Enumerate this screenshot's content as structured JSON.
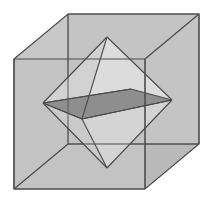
{
  "figure": {
    "caption": "",
    "width": 212,
    "height": 204,
    "background": "#ffffff",
    "projection": "oblique-parallel"
  },
  "palette": {
    "background": "#ffffff",
    "cube_face_front": "#c3c3c3",
    "cube_face_top": "#c8c8c8",
    "cube_face_left": "#bdbdbd",
    "cube_face_right": "#b9b9b9",
    "cube_face_bottom": "#c0c0c0",
    "octahedron_face_light": "#d6d6d6",
    "octahedron_face_lighter": "#dcdcdc",
    "octahedron_face_mid": "#cfcfcf",
    "equator_quad_dark": "#8e8e8e",
    "equator_quad_dark_right": "#9a9a9a",
    "stroke": "#4a4a4a",
    "stroke_light": "#5a5a5a",
    "stroke_hidden": "#6f6f6f"
  },
  "geometry": {
    "cube": {
      "label": "cube",
      "offset_x": 54,
      "offset_y": -45,
      "front_face": {
        "label": "front-face",
        "points": "14,59 145,59 145,189 14,189",
        "corners": {
          "top_left": [
            14,
            59
          ],
          "top_right": [
            145,
            59
          ],
          "bottom_right": [
            145,
            189
          ],
          "bottom_left": [
            14,
            189
          ]
        }
      },
      "back_face": {
        "label": "back-face",
        "points": "68,14 199,14 199,144 68,144",
        "corners": {
          "top_left": [
            68,
            14
          ],
          "top_right": [
            199,
            14
          ],
          "bottom_right": [
            199,
            144
          ],
          "bottom_left": [
            68,
            144
          ]
        }
      },
      "top_face": {
        "label": "top-face",
        "points": "14,59 68,14 199,14 145,59"
      },
      "left_face": {
        "label": "left-face",
        "points": "14,59 68,14 68,144 14,189"
      },
      "right_face": {
        "label": "right-face",
        "points": "145,59 199,14 199,144 145,189"
      },
      "bottom_face": {
        "label": "bottom-face",
        "points": "14,189 145,189 199,144 68,144"
      },
      "edges": [
        {
          "name": "front-top",
          "from": [
            14,
            59
          ],
          "to": [
            145,
            59
          ],
          "hidden": false
        },
        {
          "name": "front-right",
          "from": [
            145,
            59
          ],
          "to": [
            145,
            189
          ],
          "hidden": false
        },
        {
          "name": "front-bottom",
          "from": [
            14,
            189
          ],
          "to": [
            145,
            189
          ],
          "hidden": false
        },
        {
          "name": "front-left",
          "from": [
            14,
            59
          ],
          "to": [
            14,
            189
          ],
          "hidden": false
        },
        {
          "name": "back-top",
          "from": [
            68,
            14
          ],
          "to": [
            199,
            14
          ],
          "hidden": false
        },
        {
          "name": "back-right",
          "from": [
            199,
            14
          ],
          "to": [
            199,
            144
          ],
          "hidden": false
        },
        {
          "name": "back-bottom",
          "from": [
            68,
            144
          ],
          "to": [
            199,
            144
          ],
          "hidden": false
        },
        {
          "name": "back-left",
          "from": [
            68,
            14
          ],
          "to": [
            68,
            144
          ],
          "hidden": false
        },
        {
          "name": "connector-top-left",
          "from": [
            14,
            59
          ],
          "to": [
            68,
            14
          ],
          "hidden": false
        },
        {
          "name": "connector-top-right",
          "from": [
            145,
            59
          ],
          "to": [
            199,
            14
          ],
          "hidden": false
        },
        {
          "name": "connector-bottom-right",
          "from": [
            145,
            189
          ],
          "to": [
            199,
            144
          ],
          "hidden": false
        },
        {
          "name": "connector-bottom-left",
          "from": [
            14,
            189
          ],
          "to": [
            68,
            144
          ],
          "hidden": false
        }
      ]
    },
    "octahedron": {
      "label": "inscribed-octahedron",
      "vertices": {
        "top": [
          107,
          37
        ],
        "bottom": [
          107,
          168
        ],
        "left": [
          43,
          103
        ],
        "right": [
          172,
          100
        ],
        "front": [
          82,
          119
        ],
        "back": [
          131,
          89
        ]
      },
      "vertex_list": [
        {
          "name": "apex-top",
          "point": [
            107,
            37
          ],
          "note": "center of cube top face"
        },
        {
          "name": "apex-bottom",
          "point": [
            107,
            168
          ],
          "note": "center of cube bottom face"
        },
        {
          "name": "apex-left",
          "point": [
            43,
            103
          ],
          "note": "center of cube left face"
        },
        {
          "name": "apex-right",
          "point": [
            172,
            100
          ],
          "note": "center of cube right face"
        },
        {
          "name": "apex-front",
          "point": [
            82,
            119
          ],
          "note": "center of cube front face"
        },
        {
          "name": "apex-back",
          "point": [
            131,
            89
          ],
          "note": "center of cube back face"
        }
      ],
      "faces": [
        {
          "name": "face-top-front-left",
          "points": "107,37 82,119 43,103",
          "shade": "#d2d2d2",
          "hidden": false
        },
        {
          "name": "face-top-front-right",
          "points": "107,37 82,119 172,100",
          "shade": "#dcdcdc",
          "hidden": false
        },
        {
          "name": "face-top-back-left",
          "points": "107,37 131,89 43,103",
          "shade": "#cdcdcd",
          "hidden": true
        },
        {
          "name": "face-top-back-right",
          "points": "107,37 131,89 172,100",
          "shade": "#d6d6d6",
          "hidden": true
        },
        {
          "name": "face-bottom-front-left",
          "points": "107,168 82,119 43,103",
          "shade": "#cacaca",
          "hidden": false
        },
        {
          "name": "face-bottom-front-right",
          "points": "107,168 82,119 172,100",
          "shade": "#d4d4d4",
          "hidden": false
        },
        {
          "name": "face-bottom-back-left",
          "points": "107,168 131,89 43,103",
          "shade": "#d0d0d0",
          "hidden": true
        },
        {
          "name": "face-bottom-back-right",
          "points": "107,168 131,89 172,100",
          "shade": "#d8d8d8",
          "hidden": true
        }
      ],
      "edges": [
        {
          "name": "edge-top-left",
          "from": [
            107,
            37
          ],
          "to": [
            43,
            103
          ],
          "hidden": false
        },
        {
          "name": "edge-top-right",
          "from": [
            107,
            37
          ],
          "to": [
            172,
            100
          ],
          "hidden": false
        },
        {
          "name": "edge-top-front",
          "from": [
            107,
            37
          ],
          "to": [
            82,
            119
          ],
          "hidden": false
        },
        {
          "name": "edge-top-back",
          "from": [
            107,
            37
          ],
          "to": [
            131,
            89
          ],
          "hidden": true
        },
        {
          "name": "edge-bottom-left",
          "from": [
            107,
            168
          ],
          "to": [
            43,
            103
          ],
          "hidden": false
        },
        {
          "name": "edge-bottom-right",
          "from": [
            107,
            168
          ],
          "to": [
            172,
            100
          ],
          "hidden": false
        },
        {
          "name": "edge-bottom-front",
          "from": [
            107,
            168
          ],
          "to": [
            82,
            119
          ],
          "hidden": false
        },
        {
          "name": "edge-bottom-back",
          "from": [
            107,
            168
          ],
          "to": [
            131,
            89
          ],
          "hidden": true
        },
        {
          "name": "edge-equator-left-front",
          "from": [
            43,
            103
          ],
          "to": [
            82,
            119
          ],
          "hidden": false
        },
        {
          "name": "edge-equator-front-right",
          "from": [
            82,
            119
          ],
          "to": [
            172,
            100
          ],
          "hidden": false
        },
        {
          "name": "edge-equator-right-back",
          "from": [
            172,
            100
          ],
          "to": [
            131,
            89
          ],
          "hidden": false
        },
        {
          "name": "edge-equator-back-left",
          "from": [
            131,
            89
          ],
          "to": [
            43,
            103
          ],
          "hidden": false
        }
      ]
    },
    "equatorial_section": {
      "label": "equatorial-cross-section",
      "points": "43,103 131,89 172,100 82,119",
      "fill": "#8e8e8e",
      "description": "shaded square cross-section through the four equatorial vertices"
    }
  }
}
